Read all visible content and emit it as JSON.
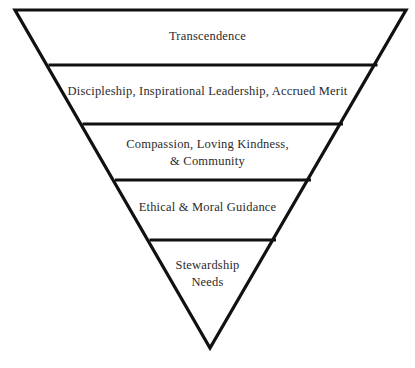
{
  "diagram": {
    "type": "inverted-pyramid",
    "title": "",
    "background_color": "#ffffff",
    "stroke_color": "#111111",
    "text_color": "#2b2b2b",
    "levels": [
      {
        "index": 1,
        "position": "top",
        "text": "Transcendence",
        "lines": [
          "Transcendence"
        ]
      },
      {
        "index": 2,
        "position": "upper-middle",
        "text": "Discipleship, Inspirational Leadership, Accrued Merit",
        "lines": [
          "Discipleship, Inspirational Leadership, Accrued Merit"
        ]
      },
      {
        "index": 3,
        "position": "middle",
        "text": "Compassion, Loving Kindness,\n& Community",
        "lines": [
          "Compassion, Loving Kindness,",
          "& Community"
        ]
      },
      {
        "index": 4,
        "position": "lower-middle",
        "text": "Ethical & Moral Guidance",
        "lines": [
          "Ethical & Moral Guidance"
        ]
      },
      {
        "index": 5,
        "position": "bottom",
        "text": "Stewardship\nNeeds",
        "lines": [
          "Stewardship",
          "Needs"
        ]
      }
    ],
    "geometry": {
      "apex_left": {
        "x": 15,
        "y": 10
      },
      "apex_right": {
        "x": 406,
        "y": 10
      },
      "apex_bottom": {
        "x": 210,
        "y": 348
      },
      "dividers_y": [
        65,
        124,
        180,
        240
      ]
    }
  }
}
